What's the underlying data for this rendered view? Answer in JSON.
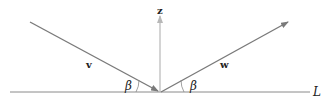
{
  "diagram": {
    "labels": {
      "z": "z",
      "v": "v",
      "w": "w",
      "beta_left": "β",
      "beta_right": "β",
      "line": "L"
    },
    "colors": {
      "line": "#8a8a8a",
      "vector": "#7a7a7a",
      "normal": "#b8b8b8",
      "text": "#222222"
    }
  }
}
